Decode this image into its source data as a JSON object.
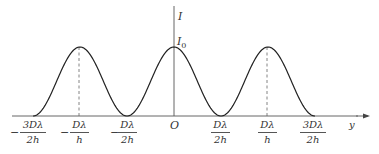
{
  "chart_data": {
    "type": "line",
    "title": "",
    "xlabel": "y",
    "ylabel": "I",
    "peak_label": "I0",
    "origin_label": "O",
    "x_ticks": [
      {
        "sign": "−",
        "num": "3Dλ",
        "den": "2h",
        "value": -1.5
      },
      {
        "sign": "−",
        "num": "Dλ",
        "den": "h",
        "value": -1.0
      },
      {
        "sign": "−",
        "num": "Dλ",
        "den": "2h",
        "value": -0.5
      },
      {
        "sign": "",
        "num": "O",
        "den": "",
        "value": 0
      },
      {
        "sign": "",
        "num": "Dλ",
        "den": "2h",
        "value": 0.5
      },
      {
        "sign": "",
        "num": "Dλ",
        "den": "h",
        "value": 1.0
      },
      {
        "sign": "",
        "num": "3Dλ",
        "den": "2h",
        "value": 1.5
      }
    ],
    "x_unit": "Dλ/h",
    "series": [
      {
        "name": "I(y) = I0 cos²(π h y / (D λ))",
        "x": [
          -1.5,
          -1.25,
          -1.0,
          -0.75,
          -0.5,
          -0.25,
          0,
          0.25,
          0.5,
          0.75,
          1.0,
          1.25,
          1.5
        ],
        "values": [
          0,
          0.5,
          1,
          0.5,
          0,
          0.5,
          1,
          0.5,
          0,
          0.5,
          1,
          0.5,
          0
        ]
      }
    ],
    "dashed_guides_at": [
      -1.0,
      1.0
    ],
    "ylim": [
      0,
      1.0
    ],
    "grid": false,
    "legend": "none"
  },
  "labels": {
    "y_axis": "I",
    "peak": "I",
    "peak_sub": "0",
    "origin": "O",
    "x_axis": "y",
    "minus": "−",
    "t1_num": "3Dλ",
    "t1_den": "2h",
    "t2_num": "Dλ",
    "t2_den": "h",
    "t3_num": "Dλ",
    "t3_den": "2h",
    "t5_num": "Dλ",
    "t5_den": "2h",
    "t6_num": "Dλ",
    "t6_den": "h",
    "t7_num": "3Dλ",
    "t7_den": "2h"
  }
}
